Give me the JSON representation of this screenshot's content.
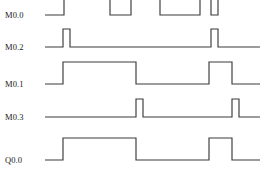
{
  "diagram": {
    "type": "timing-diagram",
    "width": 260,
    "height": 183,
    "background_color": "#ffffff",
    "line_color": "#3a3a3a",
    "label_color": "#1a1a1a",
    "label_x": 5,
    "wave_start_x": 45,
    "wave_end_x": 260,
    "signals": [
      {
        "name": "M0.0",
        "label": "M0.0",
        "label_y": 18,
        "low_y": 15,
        "high_y": -8,
        "clipped_top": true,
        "segments": [
          {
            "from": 45,
            "to": 64,
            "level": "low"
          },
          {
            "from": 64,
            "to": 64,
            "level": "rise"
          },
          {
            "from": 64,
            "to": 110,
            "level": "high"
          },
          {
            "from": 110,
            "to": 131,
            "level": "high"
          },
          {
            "from": 131,
            "to": 131,
            "level": "fall"
          },
          {
            "from": 131,
            "to": 160,
            "level": "low"
          },
          {
            "from": 160,
            "to": 160,
            "level": "rise"
          },
          {
            "from": 160,
            "to": 200,
            "level": "high"
          },
          {
            "from": 200,
            "to": 200,
            "level": "fall"
          },
          {
            "from": 200,
            "to": 211,
            "level": "low"
          },
          {
            "from": 211,
            "to": 211,
            "level": "rise"
          },
          {
            "from": 211,
            "to": 218,
            "level": "high"
          },
          {
            "from": 218,
            "to": 218,
            "level": "fall"
          },
          {
            "from": 218,
            "to": 260,
            "level": "low"
          }
        ],
        "path": "M 45 15 L 64 15 L 64 -10 M 110 -10 L 110 15 L 131 15 L 131 -10 M 160 -10 L 160 15 L 200 15 L 200 -10 M 211 -10 L 211 15 L 218 15 L 218 -10"
      },
      {
        "name": "M0.2",
        "label": "M0.2",
        "label_y": 50,
        "low_y": 47,
        "high_y": 29,
        "clipped_top": false,
        "pulses": [
          {
            "start": 63,
            "end": 70
          },
          {
            "start": 211,
            "end": 218
          }
        ],
        "path": "M 45 47 L 63 47 L 63 29 L 70 29 L 70 47 L 211 47 L 211 29 L 218 29 L 218 47 L 260 47"
      },
      {
        "name": "M0.1",
        "label": "M0.1",
        "label_y": 87,
        "low_y": 84,
        "high_y": 62,
        "clipped_top": false,
        "pulses": [
          {
            "start": 63,
            "end": 136
          },
          {
            "start": 209,
            "end": 232
          }
        ],
        "path": "M 45 84 L 63 84 L 63 62 L 136 62 L 136 84 L 209 84 L 209 62 L 232 62 L 232 84 L 260 84"
      },
      {
        "name": "M0.3",
        "label": "M0.3",
        "label_y": 120,
        "low_y": 117,
        "high_y": 99,
        "clipped_top": false,
        "pulses": [
          {
            "start": 136,
            "end": 143
          },
          {
            "start": 232,
            "end": 239
          }
        ],
        "path": "M 45 117 L 136 117 L 136 99 L 143 99 L 143 117 L 232 117 L 232 99 L 239 99 L 239 117 L 260 117"
      },
      {
        "name": "Q0.0",
        "label": "Q0.0",
        "label_y": 163,
        "low_y": 160,
        "high_y": 138,
        "clipped_top": false,
        "pulses": [
          {
            "start": 63,
            "end": 136
          },
          {
            "start": 209,
            "end": 232
          }
        ],
        "path": "M 45 160 L 63 160 L 63 138 L 136 138 L 136 160 L 209 160 L 209 138 L 232 138 L 232 160 L 260 160"
      }
    ]
  }
}
